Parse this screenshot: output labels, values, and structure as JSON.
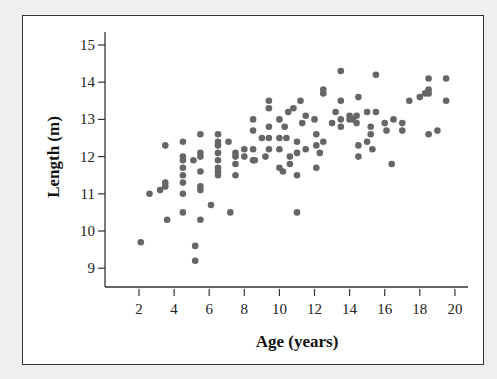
{
  "chart_data": {
    "type": "scatter",
    "title": "",
    "xlabel": "Age (years)",
    "ylabel": "Length (m)",
    "xlim": [
      0.5,
      20.5
    ],
    "ylim": [
      8.5,
      15.4
    ],
    "xticks": [
      2,
      4,
      6,
      8,
      10,
      12,
      14,
      16,
      18,
      20
    ],
    "yticks": [
      9,
      10,
      11,
      12,
      13,
      14,
      15
    ],
    "grid": false,
    "legend": null,
    "marker_color": "#666666",
    "series": [
      {
        "name": "whales",
        "points": [
          [
            2.1,
            9.7
          ],
          [
            2.6,
            11.0
          ],
          [
            3.2,
            11.1
          ],
          [
            3.5,
            11.2
          ],
          [
            3.5,
            11.3
          ],
          [
            3.5,
            12.3
          ],
          [
            3.6,
            10.3
          ],
          [
            4.5,
            12.4
          ],
          [
            4.5,
            12.0
          ],
          [
            4.5,
            11.9
          ],
          [
            4.5,
            11.7
          ],
          [
            4.5,
            11.5
          ],
          [
            4.5,
            11.3
          ],
          [
            4.5,
            11.0
          ],
          [
            4.5,
            10.5
          ],
          [
            5.1,
            11.9
          ],
          [
            5.2,
            9.6
          ],
          [
            5.2,
            9.2
          ],
          [
            5.5,
            12.6
          ],
          [
            5.5,
            12.1
          ],
          [
            5.5,
            12.0
          ],
          [
            5.5,
            11.6
          ],
          [
            5.5,
            11.2
          ],
          [
            5.5,
            11.1
          ],
          [
            5.5,
            10.3
          ],
          [
            6.1,
            10.7
          ],
          [
            6.5,
            12.6
          ],
          [
            6.5,
            12.4
          ],
          [
            6.5,
            12.3
          ],
          [
            6.5,
            12.1
          ],
          [
            6.5,
            11.9
          ],
          [
            6.5,
            11.7
          ],
          [
            6.5,
            11.6
          ],
          [
            6.5,
            11.5
          ],
          [
            7.1,
            12.4
          ],
          [
            7.2,
            10.5
          ],
          [
            7.5,
            12.1
          ],
          [
            7.5,
            12.0
          ],
          [
            7.5,
            11.8
          ],
          [
            7.5,
            11.5
          ],
          [
            8.0,
            12.2
          ],
          [
            8.0,
            12.0
          ],
          [
            8.5,
            13.0
          ],
          [
            8.5,
            12.7
          ],
          [
            8.5,
            12.2
          ],
          [
            8.5,
            11.9
          ],
          [
            8.6,
            11.9
          ],
          [
            9.0,
            12.5
          ],
          [
            9.2,
            12.0
          ],
          [
            9.4,
            13.5
          ],
          [
            9.4,
            13.3
          ],
          [
            9.4,
            12.8
          ],
          [
            9.4,
            12.5
          ],
          [
            9.4,
            12.2
          ],
          [
            10.0,
            13.0
          ],
          [
            10.0,
            12.5
          ],
          [
            10.0,
            12.2
          ],
          [
            10.0,
            11.7
          ],
          [
            10.2,
            11.6
          ],
          [
            10.3,
            12.8
          ],
          [
            10.4,
            12.5
          ],
          [
            10.5,
            13.2
          ],
          [
            10.6,
            12.0
          ],
          [
            10.6,
            11.8
          ],
          [
            10.8,
            13.3
          ],
          [
            11.0,
            12.4
          ],
          [
            11.0,
            12.1
          ],
          [
            11.0,
            11.5
          ],
          [
            11.0,
            10.5
          ],
          [
            11.2,
            13.5
          ],
          [
            11.3,
            12.9
          ],
          [
            11.5,
            13.1
          ],
          [
            11.5,
            12.2
          ],
          [
            12.0,
            13.0
          ],
          [
            12.1,
            12.6
          ],
          [
            12.1,
            12.3
          ],
          [
            12.1,
            11.7
          ],
          [
            12.3,
            12.1
          ],
          [
            12.5,
            13.8
          ],
          [
            12.5,
            13.7
          ],
          [
            12.5,
            12.4
          ],
          [
            13.0,
            12.9
          ],
          [
            13.2,
            13.2
          ],
          [
            13.5,
            14.3
          ],
          [
            13.5,
            13.5
          ],
          [
            13.5,
            13.0
          ],
          [
            13.5,
            12.8
          ],
          [
            14.0,
            13.1
          ],
          [
            14.0,
            13.0
          ],
          [
            14.2,
            13.0
          ],
          [
            14.4,
            13.1
          ],
          [
            14.4,
            12.9
          ],
          [
            14.5,
            13.6
          ],
          [
            14.5,
            12.3
          ],
          [
            14.5,
            12.0
          ],
          [
            15.0,
            13.2
          ],
          [
            15.0,
            12.4
          ],
          [
            15.2,
            12.8
          ],
          [
            15.2,
            12.6
          ],
          [
            15.3,
            12.2
          ],
          [
            15.5,
            14.2
          ],
          [
            15.5,
            13.2
          ],
          [
            16.0,
            12.9
          ],
          [
            16.1,
            12.7
          ],
          [
            16.4,
            11.8
          ],
          [
            16.5,
            13.0
          ],
          [
            17.0,
            12.9
          ],
          [
            17.0,
            12.7
          ],
          [
            17.4,
            13.5
          ],
          [
            18.0,
            13.6
          ],
          [
            18.3,
            13.7
          ],
          [
            18.5,
            14.1
          ],
          [
            18.5,
            13.8
          ],
          [
            18.5,
            13.7
          ],
          [
            18.5,
            12.6
          ],
          [
            19.0,
            12.7
          ],
          [
            19.5,
            14.1
          ],
          [
            19.5,
            13.5
          ]
        ]
      }
    ]
  },
  "axes": {
    "xlabel": "Age (years)",
    "ylabel": "Length (m)",
    "xtick_labels": [
      "2",
      "4",
      "6",
      "8",
      "10",
      "12",
      "14",
      "16",
      "18",
      "20"
    ],
    "ytick_labels": [
      "9",
      "10",
      "11",
      "12",
      "13",
      "14",
      "15"
    ]
  }
}
